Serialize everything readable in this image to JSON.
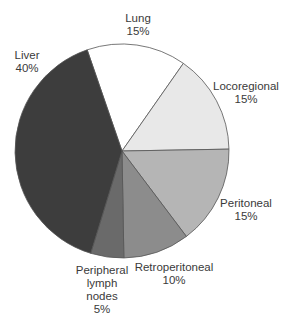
{
  "chart_data": {
    "type": "pie",
    "title": "",
    "start_angle_deg": 341,
    "direction": "clockwise",
    "slices": [
      {
        "label": "Lung",
        "value": 15,
        "display": "15%",
        "color": "#ffffff"
      },
      {
        "label": "Locoregional",
        "value": 15,
        "display": "15%",
        "color": "#e8e8e8"
      },
      {
        "label": "Peritoneal",
        "value": 15,
        "display": "15%",
        "color": "#b5b5b5"
      },
      {
        "label": "Retroperitoneal",
        "value": 10,
        "display": "10%",
        "color": "#8c8c8c"
      },
      {
        "label": "Peripheral lymph nodes",
        "value": 5,
        "display": "5%",
        "color": "#6a6a6a"
      },
      {
        "label": "Liver",
        "value": 40,
        "display": "40%",
        "color": "#3d3d3d"
      }
    ],
    "legend": "none (direct labels)"
  },
  "labels": {
    "lung": {
      "line1": "Lung",
      "pct": "15%"
    },
    "locoregional": {
      "line1": "Locoregional",
      "pct": "15%"
    },
    "peritoneal": {
      "line1": "Peritoneal",
      "pct": "15%"
    },
    "retroperitoneal": {
      "line1": "Retroperitoneal",
      "pct": "10%"
    },
    "peripheral": {
      "line1": "Peripheral",
      "line2": "lymph",
      "line3": "nodes",
      "pct": "5%"
    },
    "liver": {
      "line1": "Liver",
      "pct": "40%"
    }
  }
}
